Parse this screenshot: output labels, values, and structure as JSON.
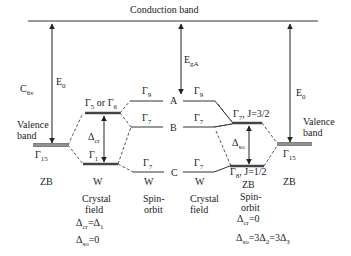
{
  "conduction_band": {
    "label": "Conduction band"
  },
  "symmetry": {
    "label": "C",
    "sub": "6v"
  },
  "left_valence": {
    "label_line1": "Valence",
    "label_line2": "band",
    "gamma": "Γ",
    "gamma_sub": "15",
    "structure": "ZB"
  },
  "right_valence": {
    "label_line1": "Valence",
    "label_line2": "band",
    "gamma": "Γ",
    "gamma_sub": "15",
    "structure": "ZB"
  },
  "gaps": {
    "left_e0": {
      "main": "E",
      "sub": "0"
    },
    "right_e0": {
      "main": "E",
      "sub": "0"
    },
    "ega": {
      "main": "E",
      "sub": "gA"
    },
    "delta_cr": {
      "main": "Δ",
      "sub": "cr"
    },
    "delta_so": {
      "main": "Δ",
      "sub": "so"
    }
  },
  "crystal_field_w": {
    "upper": {
      "g1": "Γ",
      "s1": "5",
      "or": " or ",
      "g2": "Γ",
      "s2": "6"
    },
    "lower": {
      "g": "Γ",
      "s": "1"
    },
    "structure": "W",
    "title_line1": "Crystal",
    "title_line2": "field",
    "eq1": {
      "a": "Δ",
      "as": "cr",
      "eq": "=Δ",
      "bs": "1"
    },
    "eq2": {
      "a": "Δ",
      "as": "so",
      "eq": "=0"
    }
  },
  "spin_orbit_w": {
    "levels": [
      {
        "g": "Γ",
        "s": "9",
        "point": "A"
      },
      {
        "g": "Γ",
        "s": "7",
        "point": "B"
      },
      {
        "g": "Γ",
        "s": "7",
        "point": "C"
      }
    ],
    "structure": "W",
    "title_line1": "Spin-",
    "title_line2": "orbit"
  },
  "crystal_field_w2": {
    "levels": [
      {
        "g": "Γ",
        "s": "9"
      },
      {
        "g": "Γ",
        "s": "7"
      },
      {
        "g": "Γ",
        "s": "7"
      }
    ],
    "structure": "W",
    "title_line1": "Crystal",
    "title_line2": "field"
  },
  "spin_orbit_zb": {
    "upper": {
      "g": "Γ",
      "s": "7",
      "j": ", J=3/2"
    },
    "lower": {
      "g": "Γ",
      "s": "8",
      "j": ", J=1/2"
    },
    "structure": "ZB",
    "title_line1": "Spin-",
    "title_line2": "orbit",
    "eq1": {
      "a": "Δ",
      "as": "cr",
      "eq": "=0"
    },
    "eq2": {
      "a": "Δ",
      "as": "so",
      "eq": "=3Δ",
      "bs": "2",
      "eq2": "=3Δ",
      "cs": "3"
    }
  }
}
